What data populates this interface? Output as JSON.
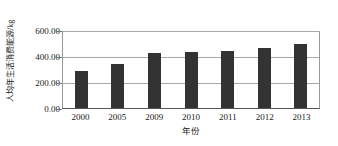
{
  "chart_data": {
    "type": "bar",
    "title": "",
    "subtitle": "",
    "categories": [
      "2000",
      "2005",
      "2009",
      "2010",
      "2011",
      "2012",
      "2013"
    ],
    "values": [
      292.0,
      346.0,
      431.0,
      438.0,
      446.0,
      469.0,
      500.0
    ],
    "series": [
      {
        "name": "人均年生活消费能源",
        "values": [
          292.0,
          346.0,
          431.0,
          438.0,
          446.0,
          469.0,
          500.0
        ]
      }
    ],
    "xlabel": "年份",
    "ylabel": "人均年生活消费能源/kg",
    "ylim": [
      0,
      600
    ],
    "ytick_values": [
      0,
      200,
      400,
      600
    ],
    "ytick_labels": [
      "0.00",
      "200.00",
      "400.00",
      "600.00"
    ],
    "grid": true,
    "grid_axis": "y",
    "legend": false,
    "legend_position": "none",
    "bar_color": "#333333",
    "gridline_color": "#a8a8a8",
    "axis_color": "#555555",
    "background_color": "#ffffff"
  },
  "axes": {
    "y_title": "人均年生活消费能源/kg",
    "x_title": "年份",
    "y_ticks": [
      {
        "label": "600.00",
        "value": 600
      },
      {
        "label": "400.00",
        "value": 400
      },
      {
        "label": "200.00",
        "value": 200
      },
      {
        "label": "0.00",
        "value": 0
      }
    ],
    "x_ticks": [
      {
        "label": "2000"
      },
      {
        "label": "2005"
      },
      {
        "label": "2009"
      },
      {
        "label": "2010"
      },
      {
        "label": "2011"
      },
      {
        "label": "2012"
      },
      {
        "label": "2013"
      }
    ]
  }
}
